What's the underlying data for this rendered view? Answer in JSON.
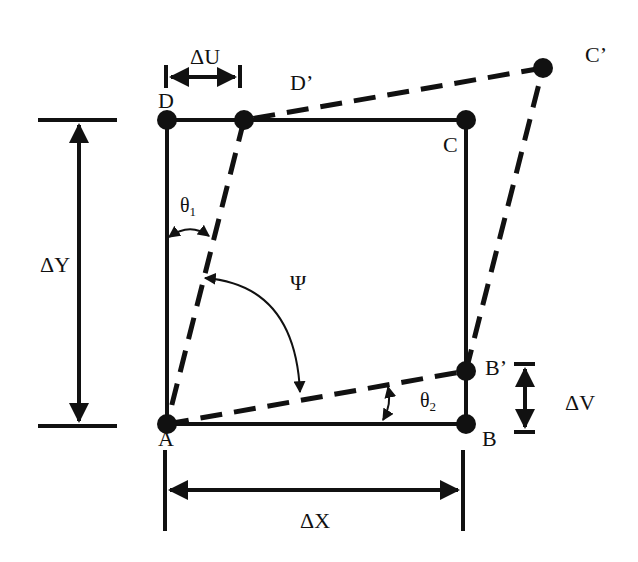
{
  "diagram": {
    "colors": {
      "stroke": "#111111",
      "background": "#ffffff"
    },
    "points": {
      "A": {
        "label": "A",
        "x": 167,
        "y": 424
      },
      "B": {
        "label": "B",
        "x": 466,
        "y": 424
      },
      "C": {
        "label": "C",
        "x": 466,
        "y": 120
      },
      "D": {
        "label": "D",
        "x": 167,
        "y": 120
      },
      "Bp": {
        "label": "B’",
        "x": 466,
        "y": 371
      },
      "Cp": {
        "label": "C’",
        "x": 543,
        "y": 68
      },
      "Dp": {
        "label": "D’",
        "x": 244,
        "y": 120
      }
    },
    "original_square": [
      "A",
      "B",
      "C",
      "D"
    ],
    "deformed_shape": [
      "A",
      "Bp",
      "Cp",
      "Dp"
    ],
    "dimensions": {
      "dU": "ΔU",
      "dV": "ΔV",
      "dX": "ΔX",
      "dY": "ΔY"
    },
    "angles": {
      "theta1": {
        "symbol": "θ",
        "sub": "1"
      },
      "theta2": {
        "symbol": "θ",
        "sub": "2"
      },
      "psi": "Ψ"
    }
  }
}
